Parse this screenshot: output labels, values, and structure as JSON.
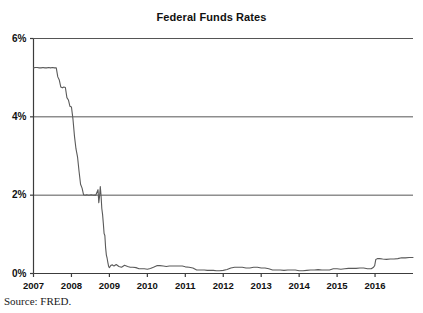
{
  "figure": {
    "title": "Federal Funds Rates",
    "source_note": "Source: FRED.",
    "clipped_top_fragment": "",
    "colors": {
      "line": "#5a5a5a",
      "grid": "#555555",
      "axis": "#3c3c3c",
      "text": "#111111",
      "background": "#ffffff"
    }
  },
  "chart_data": {
    "type": "line",
    "title": "Federal Funds Rates",
    "xlabel": "",
    "ylabel": "",
    "ylim": [
      0,
      6
    ],
    "xlim": [
      2007.0,
      2017.0
    ],
    "ytick_labels": [
      "0%",
      "2%",
      "4%",
      "6%"
    ],
    "ytick_values": [
      0,
      2,
      4,
      6
    ],
    "xtick_labels": [
      "2007",
      "2008",
      "2009",
      "2010",
      "2011",
      "2012",
      "2013",
      "2014",
      "2015",
      "2016"
    ],
    "xtick_values": [
      2007,
      2008,
      2009,
      2010,
      2011,
      2012,
      2013,
      2014,
      2015,
      2016
    ],
    "grid": true,
    "grid_axis": "y",
    "legend": false,
    "legend_position": "none",
    "series": [
      {
        "name": "Federal Funds Rate",
        "units": "percent",
        "x": [
          2007.0,
          2007.05,
          2007.1,
          2007.15,
          2007.2,
          2007.25,
          2007.3,
          2007.35,
          2007.4,
          2007.45,
          2007.5,
          2007.55,
          2007.6,
          2007.64,
          2007.68,
          2007.72,
          2007.76,
          2007.8,
          2007.84,
          2007.88,
          2007.92,
          2007.96,
          2008.0,
          2008.04,
          2008.08,
          2008.12,
          2008.16,
          2008.2,
          2008.24,
          2008.28,
          2008.32,
          2008.36,
          2008.4,
          2008.46,
          2008.52,
          2008.58,
          2008.64,
          2008.7,
          2008.72,
          2008.74,
          2008.76,
          2008.78,
          2008.8,
          2008.82,
          2008.84,
          2008.86,
          2008.88,
          2008.9,
          2008.92,
          2008.94,
          2008.96,
          2008.98,
          2009.0,
          2009.04,
          2009.08,
          2009.12,
          2009.18,
          2009.25,
          2009.32,
          2009.4,
          2009.48,
          2009.55,
          2009.62,
          2009.7,
          2009.78,
          2009.85,
          2009.92,
          2010.0,
          2010.08,
          2010.16,
          2010.25,
          2010.33,
          2010.42,
          2010.5,
          2010.58,
          2010.66,
          2010.75,
          2010.84,
          2010.92,
          2011.0,
          2011.1,
          2011.2,
          2011.3,
          2011.4,
          2011.5,
          2011.58,
          2011.66,
          2011.74,
          2011.82,
          2011.9,
          2012.0,
          2012.1,
          2012.2,
          2012.3,
          2012.4,
          2012.5,
          2012.6,
          2012.7,
          2012.8,
          2012.9,
          2013.0,
          2013.1,
          2013.2,
          2013.3,
          2013.4,
          2013.5,
          2013.6,
          2013.7,
          2013.8,
          2013.9,
          2014.0,
          2014.1,
          2014.2,
          2014.3,
          2014.4,
          2014.5,
          2014.6,
          2014.7,
          2014.8,
          2014.9,
          2015.0,
          2015.1,
          2015.2,
          2015.3,
          2015.4,
          2015.5,
          2015.6,
          2015.7,
          2015.8,
          2015.9,
          2015.96,
          2015.99,
          2016.02,
          2016.06,
          2016.12,
          2016.2,
          2016.3,
          2016.4,
          2016.5,
          2016.6,
          2016.7,
          2016.8,
          2016.9,
          2017.0
        ],
        "y": [
          5.25,
          5.26,
          5.26,
          5.25,
          5.25,
          5.26,
          5.25,
          5.25,
          5.26,
          5.25,
          5.26,
          5.25,
          5.25,
          5.02,
          4.94,
          4.76,
          4.74,
          4.76,
          4.75,
          4.49,
          4.43,
          4.27,
          4.25,
          3.94,
          3.5,
          3.18,
          2.98,
          2.61,
          2.28,
          2.18,
          2.01,
          2.0,
          2.01,
          2.0,
          2.01,
          2.0,
          2.0,
          2.14,
          1.81,
          1.96,
          2.22,
          1.99,
          1.66,
          1.51,
          1.28,
          1.02,
          0.97,
          0.66,
          0.47,
          0.39,
          0.28,
          0.18,
          0.15,
          0.21,
          0.22,
          0.19,
          0.23,
          0.18,
          0.16,
          0.21,
          0.18,
          0.16,
          0.16,
          0.15,
          0.12,
          0.12,
          0.12,
          0.11,
          0.13,
          0.16,
          0.2,
          0.2,
          0.19,
          0.18,
          0.19,
          0.19,
          0.19,
          0.19,
          0.19,
          0.17,
          0.16,
          0.14,
          0.09,
          0.09,
          0.09,
          0.08,
          0.08,
          0.08,
          0.07,
          0.07,
          0.08,
          0.1,
          0.14,
          0.16,
          0.16,
          0.16,
          0.14,
          0.14,
          0.16,
          0.16,
          0.14,
          0.14,
          0.12,
          0.09,
          0.09,
          0.09,
          0.08,
          0.09,
          0.09,
          0.09,
          0.07,
          0.07,
          0.08,
          0.09,
          0.09,
          0.1,
          0.09,
          0.09,
          0.09,
          0.12,
          0.12,
          0.11,
          0.12,
          0.13,
          0.13,
          0.13,
          0.14,
          0.14,
          0.12,
          0.12,
          0.16,
          0.2,
          0.36,
          0.38,
          0.38,
          0.37,
          0.36,
          0.37,
          0.37,
          0.38,
          0.4,
          0.4,
          0.41,
          0.41
        ]
      }
    ],
    "annotations": [
      {
        "text": "rate held at 5.25% through mid-2007"
      },
      {
        "text": "staircase easing during 2007-2008"
      },
      {
        "text": "near-zero lower bound 2009-2015"
      },
      {
        "text": "liftoff at the start of 2016"
      }
    ]
  }
}
